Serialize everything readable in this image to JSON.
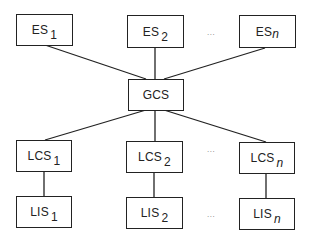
{
  "diagram": {
    "type": "hierarchy",
    "line_color": "#222222",
    "nodes": {
      "es1": {
        "base": "ES",
        "sub": "1"
      },
      "es2": {
        "base": "ES",
        "sub": "2"
      },
      "esn": {
        "base": "ES",
        "sub": "n"
      },
      "gcs": {
        "base": "GCS",
        "sub": ""
      },
      "lcs1": {
        "base": "LCS",
        "sub": "1"
      },
      "lcs2": {
        "base": "LCS",
        "sub": "2"
      },
      "lcsn": {
        "base": "LCS",
        "sub": "n"
      },
      "lis1": {
        "base": "LIS",
        "sub": "1"
      },
      "lis2": {
        "base": "LIS",
        "sub": "2"
      },
      "lisn": {
        "base": "LIS",
        "sub": "n"
      }
    },
    "edges": [
      [
        "es1",
        "gcs"
      ],
      [
        "es2",
        "gcs"
      ],
      [
        "esn",
        "gcs"
      ],
      [
        "gcs",
        "lcs1"
      ],
      [
        "gcs",
        "lcs2"
      ],
      [
        "gcs",
        "lcsn"
      ],
      [
        "lcs1",
        "lis1"
      ],
      [
        "lcs2",
        "lis2"
      ],
      [
        "lcsn",
        "lisn"
      ]
    ],
    "ellipsis": "..."
  }
}
